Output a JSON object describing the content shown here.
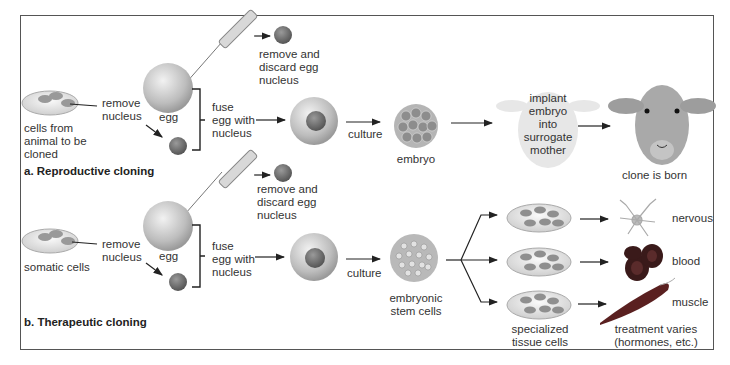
{
  "panels": [
    {
      "title": "a. Reproductive cloning",
      "labels": {
        "source_cells": "cells from\nanimal to be\ncloned",
        "remove_nucleus": "remove\nnucleus",
        "egg": "egg",
        "discard": "remove and\ndiscard egg\nnucleus",
        "fuse": "fuse\negg with\nnucleus",
        "culture": "culture",
        "embryo": "embryo",
        "implant": "implant\nembryo\ninto\nsurrogate\nmother",
        "result": "clone is born"
      }
    },
    {
      "title": "b. Therapeutic cloning",
      "labels": {
        "source_cells": "somatic cells",
        "remove_nucleus": "remove\nnucleus",
        "egg": "egg",
        "discard": "remove and\ndiscard egg\nnucleus",
        "fuse": "fuse\negg with\nnucleus",
        "culture": "culture",
        "embryo": "embryonic\nstem cells",
        "tissue": "specialized\ntissue cells",
        "treatment": "treatment varies\n(hormones, etc.)",
        "outcomes": [
          "nervous",
          "blood",
          "muscle"
        ]
      }
    }
  ],
  "colors": {
    "frame": "#555555",
    "text": "#333333",
    "cell_fill": "#c9c9c9",
    "nucleus": "#7a7a7a",
    "blood": "#3a1a1a",
    "muscle": "#5a2020"
  }
}
